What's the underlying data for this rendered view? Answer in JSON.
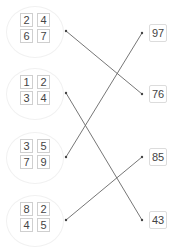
{
  "left_groups": [
    {
      "caption": "",
      "digits": [
        "2",
        "4",
        "6",
        "7"
      ]
    },
    {
      "caption": "",
      "digits": [
        "1",
        "2",
        "3",
        "4"
      ]
    },
    {
      "caption": "",
      "digits": [
        "3",
        "5",
        "7",
        "9"
      ]
    },
    {
      "caption": "",
      "digits": [
        "8",
        "2",
        "4",
        "5"
      ]
    }
  ],
  "right_values": [
    "97",
    "76",
    "85",
    "43"
  ],
  "connections": [
    {
      "from_group": 1,
      "to_value": "76"
    },
    {
      "from_group": 2,
      "to_value": "43"
    },
    {
      "from_group": 3,
      "to_value": "97"
    },
    {
      "from_group": 4,
      "to_value": "85"
    }
  ],
  "colors": {
    "line": "#666666",
    "box_border": "#cfcfcf"
  }
}
